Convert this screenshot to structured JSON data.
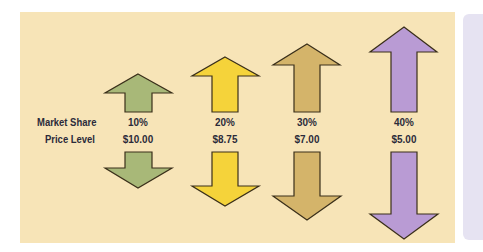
{
  "row_labels": {
    "market_share": "Market Share",
    "price_level": "Price Level"
  },
  "columns": [
    {
      "market_share": "10%",
      "price_level": "$10.00",
      "color": "#a8b878"
    },
    {
      "market_share": "20%",
      "price_level": "$8.75",
      "color": "#f5d33a"
    },
    {
      "market_share": "30%",
      "price_level": "$7.00",
      "color": "#d4b46a"
    },
    {
      "market_share": "40%",
      "price_level": "$5.00",
      "color": "#b99bd4"
    }
  ],
  "colors": {
    "panel_background": "#f7e4b7",
    "side_panel": "#e6e3f2",
    "arrow_outline": "#3a2f1a"
  }
}
